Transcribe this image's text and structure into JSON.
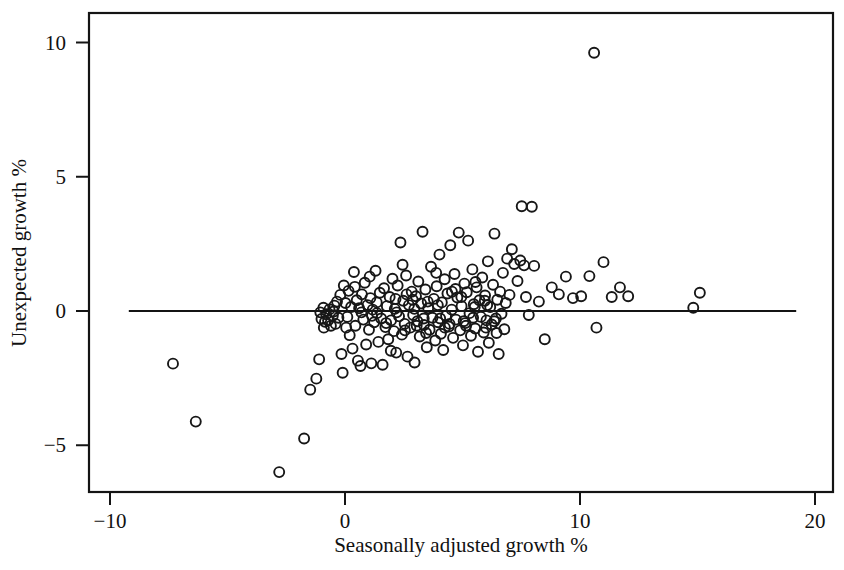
{
  "chart_data": {
    "type": "scatter",
    "title": "",
    "subtitle": "",
    "xlabel": "Seasonally adjusted growth %",
    "ylabel": "Unexpected growth %",
    "xlim": [
      -10,
      20
    ],
    "ylim": [
      -6.6,
      10.6
    ],
    "xticks": [
      -10,
      0,
      10,
      20
    ],
    "xticklabels": [
      "−10",
      "0",
      "10",
      "20"
    ],
    "yticks": [
      -5,
      0,
      5,
      10
    ],
    "yticklabels": [
      "−5",
      "0",
      "5",
      "10"
    ],
    "grid": false,
    "legend": null,
    "annotations": [
      {
        "kind": "reference-line",
        "orientation": "horizontal",
        "y": 0,
        "x_start": -9.2,
        "x_end": 19.2
      }
    ],
    "marker": {
      "shape": "open-circle",
      "radius": 5.0,
      "fill": "none",
      "edge_color": "#171717",
      "edge_width": 1.9
    },
    "series": [
      {
        "name": "observations",
        "n_points": 205,
        "points": [
          [
            -7.32,
            -1.96
          ],
          [
            -6.35,
            -4.12
          ],
          [
            -2.8,
            -6.0
          ],
          [
            -1.74,
            -4.75
          ],
          [
            -1.48,
            -2.93
          ],
          [
            -1.22,
            -2.52
          ],
          [
            -1.1,
            -1.8
          ],
          [
            -1.05,
            -0.05
          ],
          [
            -1.0,
            -0.3
          ],
          [
            -0.92,
            0.12
          ],
          [
            -0.85,
            -0.4
          ],
          [
            -0.8,
            -0.12
          ],
          [
            -0.72,
            -0.35
          ],
          [
            -0.66,
            0.06
          ],
          [
            -0.6,
            -0.55
          ],
          [
            -0.52,
            -0.18
          ],
          [
            -0.45,
            0.2
          ],
          [
            -0.4,
            -0.48
          ],
          [
            -0.34,
            0.35
          ],
          [
            -0.28,
            -0.25
          ],
          [
            -0.2,
            0.6
          ],
          [
            -0.15,
            -1.6
          ],
          [
            -0.1,
            -2.3
          ],
          [
            -0.05,
            0.95
          ],
          [
            0.02,
            0.3
          ],
          [
            0.1,
            -0.22
          ],
          [
            0.15,
            0.75
          ],
          [
            0.2,
            -0.9
          ],
          [
            0.26,
            0.15
          ],
          [
            0.32,
            -1.4
          ],
          [
            0.38,
            1.45
          ],
          [
            0.44,
            -0.55
          ],
          [
            0.5,
            0.4
          ],
          [
            0.55,
            -1.85
          ],
          [
            0.6,
            0.1
          ],
          [
            0.66,
            -2.05
          ],
          [
            0.72,
            0.62
          ],
          [
            0.78,
            -0.32
          ],
          [
            0.84,
            1.05
          ],
          [
            0.9,
            -1.25
          ],
          [
            0.96,
            0.22
          ],
          [
            1.02,
            -0.7
          ],
          [
            1.08,
            0.48
          ],
          [
            1.12,
            -1.95
          ],
          [
            1.18,
            0.05
          ],
          [
            1.24,
            -0.42
          ],
          [
            1.3,
            1.5
          ],
          [
            1.36,
            -0.08
          ],
          [
            1.42,
            -1.15
          ],
          [
            1.48,
            0.68
          ],
          [
            1.54,
            -0.28
          ],
          [
            1.6,
            -2.0
          ],
          [
            1.66,
            0.85
          ],
          [
            1.72,
            -0.6
          ],
          [
            1.78,
            0.18
          ],
          [
            1.84,
            -1.05
          ],
          [
            1.9,
            0.52
          ],
          [
            1.96,
            -0.35
          ],
          [
            2.02,
            1.2
          ],
          [
            2.08,
            -0.75
          ],
          [
            2.12,
            0.08
          ],
          [
            2.18,
            -1.55
          ],
          [
            2.24,
            0.95
          ],
          [
            2.3,
            -0.2
          ],
          [
            2.36,
            2.55
          ],
          [
            2.42,
            -0.88
          ],
          [
            2.48,
            0.38
          ],
          [
            2.54,
            -0.48
          ],
          [
            2.6,
            1.32
          ],
          [
            2.66,
            -1.7
          ],
          [
            2.72,
            0.22
          ],
          [
            2.78,
            -0.62
          ],
          [
            2.84,
            0.72
          ],
          [
            2.9,
            -0.15
          ],
          [
            2.96,
            -1.92
          ],
          [
            3.02,
            0.55
          ],
          [
            3.08,
            -0.38
          ],
          [
            3.12,
            1.1
          ],
          [
            3.18,
            -0.95
          ],
          [
            3.24,
            0.28
          ],
          [
            3.3,
            2.95
          ],
          [
            3.36,
            -0.52
          ],
          [
            3.42,
            0.8
          ],
          [
            3.48,
            -1.35
          ],
          [
            3.54,
            0.1
          ],
          [
            3.6,
            -0.7
          ],
          [
            3.66,
            1.65
          ],
          [
            3.72,
            -0.25
          ],
          [
            3.78,
            0.45
          ],
          [
            3.84,
            -1.1
          ],
          [
            3.9,
            0.92
          ],
          [
            3.96,
            -0.42
          ],
          [
            4.02,
            2.1
          ],
          [
            4.08,
            -0.85
          ],
          [
            4.12,
            0.32
          ],
          [
            4.18,
            -1.45
          ],
          [
            4.24,
            1.18
          ],
          [
            4.3,
            -0.18
          ],
          [
            4.36,
            0.65
          ],
          [
            4.42,
            -0.58
          ],
          [
            4.48,
            2.45
          ],
          [
            4.54,
            0.05
          ],
          [
            4.6,
            -1.0
          ],
          [
            4.66,
            1.38
          ],
          [
            4.72,
            -0.32
          ],
          [
            4.78,
            0.5
          ],
          [
            4.84,
            2.92
          ],
          [
            4.9,
            -0.72
          ],
          [
            4.96,
            0.18
          ],
          [
            5.02,
            -1.28
          ],
          [
            5.08,
            1.02
          ],
          [
            5.12,
            -0.45
          ],
          [
            5.18,
            0.7
          ],
          [
            5.24,
            2.62
          ],
          [
            5.3,
            -0.08
          ],
          [
            5.36,
            -0.92
          ],
          [
            5.42,
            1.55
          ],
          [
            5.48,
            0.25
          ],
          [
            5.54,
            -0.65
          ],
          [
            5.6,
            0.88
          ],
          [
            5.66,
            -1.52
          ],
          [
            5.72,
            0.4
          ],
          [
            5.78,
            -0.22
          ],
          [
            5.84,
            1.25
          ],
          [
            5.9,
            -0.8
          ],
          [
            5.96,
            0.58
          ],
          [
            6.02,
            -0.35
          ],
          [
            6.08,
            1.85
          ],
          [
            6.12,
            -1.18
          ],
          [
            6.18,
            0.15
          ],
          [
            6.24,
            -0.5
          ],
          [
            6.3,
            0.98
          ],
          [
            6.36,
            2.88
          ],
          [
            6.42,
            -0.28
          ],
          [
            6.48,
            0.42
          ],
          [
            6.54,
            -1.6
          ],
          [
            6.6,
            0.72
          ],
          [
            6.66,
            -0.1
          ],
          [
            6.72,
            1.42
          ],
          [
            6.78,
            -0.68
          ],
          [
            6.84,
            0.3
          ],
          [
            6.9,
            1.95
          ],
          [
            7.0,
            0.6
          ],
          [
            7.1,
            2.3
          ],
          [
            7.2,
            1.75
          ],
          [
            7.34,
            1.12
          ],
          [
            7.46,
            1.88
          ],
          [
            7.52,
            3.9
          ],
          [
            7.95,
            3.88
          ],
          [
            7.62,
            1.7
          ],
          [
            7.7,
            0.52
          ],
          [
            7.82,
            -0.15
          ],
          [
            8.05,
            1.68
          ],
          [
            8.25,
            0.35
          ],
          [
            8.5,
            -1.05
          ],
          [
            8.8,
            0.88
          ],
          [
            9.1,
            0.62
          ],
          [
            9.4,
            1.28
          ],
          [
            9.7,
            0.48
          ],
          [
            10.05,
            0.55
          ],
          [
            10.4,
            1.3
          ],
          [
            10.6,
            9.62
          ],
          [
            10.7,
            -0.62
          ],
          [
            11.0,
            1.82
          ],
          [
            11.35,
            0.52
          ],
          [
            11.7,
            0.88
          ],
          [
            12.05,
            0.55
          ],
          [
            14.82,
            0.12
          ],
          [
            15.1,
            0.68
          ],
          [
            0.05,
            -0.62
          ],
          [
            0.42,
            0.9
          ],
          [
            1.05,
            1.28
          ],
          [
            1.95,
            -1.48
          ],
          [
            2.45,
            1.72
          ],
          [
            2.88,
            0.42
          ],
          [
            3.35,
            -0.28
          ],
          [
            3.88,
            1.42
          ],
          [
            4.25,
            -0.62
          ],
          [
            4.7,
            0.82
          ],
          [
            5.15,
            -0.55
          ],
          [
            5.55,
            1.08
          ],
          [
            6.05,
            0.22
          ],
          [
            6.45,
            -0.82
          ],
          [
            2.2,
            -0.05
          ],
          [
            2.62,
            0.62
          ],
          [
            3.05,
            -0.55
          ],
          [
            3.52,
            0.35
          ],
          [
            4.05,
            -0.28
          ],
          [
            4.55,
            0.72
          ],
          [
            5.05,
            -0.38
          ],
          [
            5.52,
            0.15
          ],
          [
            6.0,
            -0.62
          ],
          [
            1.35,
            0.32
          ],
          [
            1.75,
            -0.45
          ],
          [
            2.15,
            0.45
          ],
          [
            2.55,
            -0.72
          ],
          [
            2.95,
            0.08
          ],
          [
            3.45,
            -0.82
          ],
          [
            3.95,
            0.22
          ],
          [
            4.45,
            -0.48
          ],
          [
            4.95,
            0.52
          ],
          [
            5.45,
            -0.25
          ],
          [
            5.95,
            0.38
          ],
          [
            6.35,
            -0.38
          ],
          [
            0.7,
            -0.05
          ],
          [
            1.15,
            -0.18
          ],
          [
            -0.48,
            -0.02
          ],
          [
            -0.9,
            -0.62
          ]
        ]
      }
    ]
  },
  "axes": {
    "x_title": "Seasonally adjusted growth %",
    "y_title": "Unexpected growth %",
    "x_tick_labels": [
      "−10",
      "0",
      "10",
      "20"
    ],
    "y_tick_labels": [
      "10",
      "5",
      "0",
      "−5"
    ]
  },
  "colors": {
    "background": "#ffffff",
    "ink": "#141414",
    "marker_edge": "#171717"
  }
}
